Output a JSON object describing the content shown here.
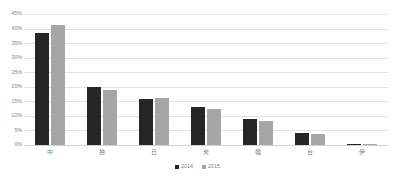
{
  "chart_data": {
    "type": "bar",
    "title": "",
    "subtitle": "",
    "xlabel": "",
    "ylabel": "",
    "ylim": [
      0,
      45
    ],
    "ytick_labels": [
      "45%",
      "40%",
      "35%",
      "30%",
      "25%",
      "20%",
      "15%",
      "10%",
      "5%",
      "0%"
    ],
    "ytick_values": [
      45,
      40,
      35,
      30,
      25,
      20,
      15,
      10,
      5,
      0
    ],
    "grid": true,
    "value_suffix": "%",
    "legend_position": "bottom-center",
    "categories": [
      "中",
      "独",
      "日",
      "米",
      "韓",
      "台",
      "伊"
    ],
    "series": [
      {
        "name": "2014",
        "color": "#262626",
        "values": [
          38.5,
          20.0,
          15.7,
          12.9,
          9.1,
          4.0,
          0.5
        ]
      },
      {
        "name": "2015",
        "color": "#a6a6a6",
        "values": [
          41.2,
          19.0,
          16.0,
          12.4,
          8.1,
          3.7,
          0.3
        ]
      }
    ]
  },
  "legend": {
    "items": [
      {
        "label": "2014",
        "color": "#262626"
      },
      {
        "label": "2015",
        "color": "#a6a6a6"
      }
    ]
  },
  "colors": {
    "series_2014": "#262626",
    "series_2015": "#a6a6a6",
    "gridline": "#e4e4e4",
    "axis_text": "#7f7f7f",
    "background": "#ffffff"
  }
}
